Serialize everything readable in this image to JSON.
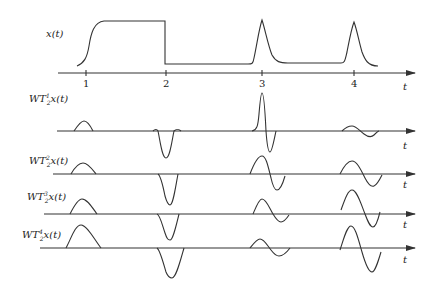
{
  "diagram": {
    "signal": {
      "label": "x(t)",
      "axis_label": "t",
      "ticks": [
        "1",
        "2",
        "3",
        "4"
      ]
    },
    "rows": [
      {
        "label_main": "WT",
        "label_sub": "2",
        "label_sup": "1",
        "label_tail": "x(t)",
        "axis_label": "t"
      },
      {
        "label_main": "WT",
        "label_sub": "2",
        "label_sup": "2",
        "label_tail": "x(t)",
        "axis_label": "t"
      },
      {
        "label_main": "WT",
        "label_sub": "2",
        "label_sup": "3",
        "label_tail": "x(t)",
        "axis_label": "t"
      },
      {
        "label_main": "WT",
        "label_sub": "2",
        "label_sup": "4",
        "label_tail": "x(t)",
        "axis_label": "t"
      }
    ],
    "colors": {
      "stroke": "#333333",
      "background": "#ffffff"
    }
  }
}
